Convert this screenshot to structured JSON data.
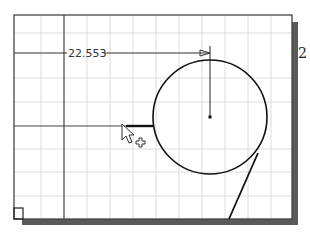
{
  "canvas": {
    "background": "#ffffff",
    "grid_color": "#dcdcdc",
    "frame_color": "#555555",
    "shadow_color": "#5a5a5a",
    "sketch_color": "#111111"
  },
  "dimension": {
    "value": "22.553"
  },
  "side_label": "2",
  "icons": {
    "cursor": "arrow-pointer-icon",
    "crosshair": "plus-crosshair-icon",
    "origin_marker": "origin-square-icon"
  }
}
